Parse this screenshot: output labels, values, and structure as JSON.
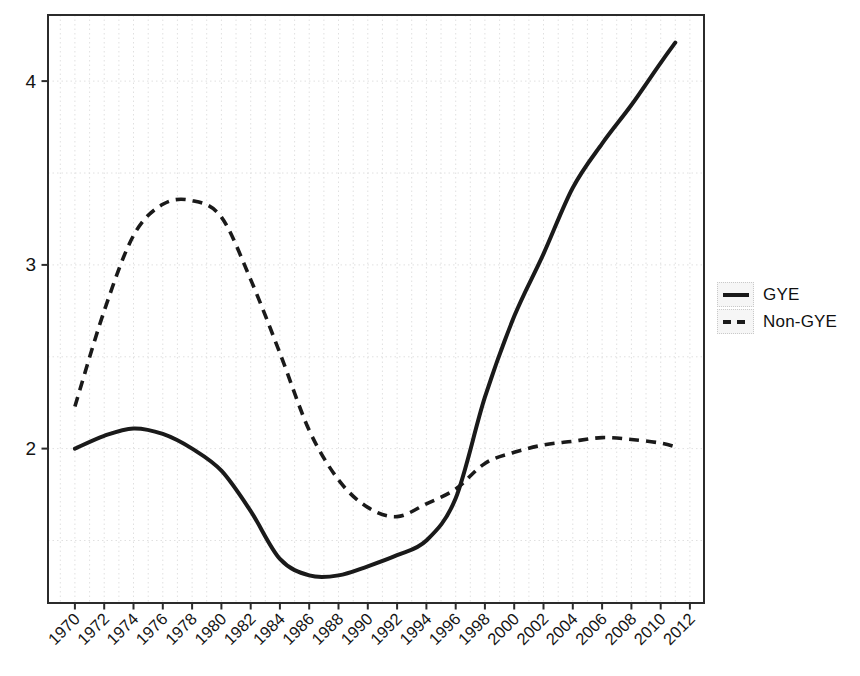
{
  "chart": {
    "background": "#ffffff",
    "curve_color": "#1a1a1a",
    "axis_color": "#2b2b2b",
    "grid_color": "#e0e0e0",
    "label_color": "#141414",
    "legend_key_bg": "#f6f6f6",
    "legend_key_border": "#c9c9c9"
  },
  "chart_data": {
    "type": "line",
    "title": "",
    "xlabel": "",
    "ylabel": "",
    "grid": "faint dotted, vertical every year, horizontal every 0.5",
    "legend_position": "right-middle",
    "x_ticks": [
      1970,
      1972,
      1974,
      1976,
      1978,
      1980,
      1982,
      1984,
      1986,
      1988,
      1990,
      1992,
      1994,
      1996,
      1998,
      2000,
      2002,
      2004,
      2006,
      2008,
      2010,
      2012
    ],
    "y_ticks": [
      2,
      3,
      4
    ],
    "x_range": [
      1968.16,
      2012.96
    ],
    "ylim": [
      1.16,
      4.36
    ],
    "y_grid_step": 0.5,
    "x_grid_step": 1,
    "x": [
      1970,
      1972,
      1974,
      1976,
      1978,
      1980,
      1982,
      1984,
      1986,
      1988,
      1990,
      1992,
      1994,
      1996,
      1998,
      2000,
      2002,
      2004,
      2006,
      2008,
      2010,
      2011
    ],
    "series": [
      {
        "name": "GYE",
        "style": "solid",
        "values": [
          2.0,
          2.07,
          2.11,
          2.08,
          2.0,
          1.88,
          1.66,
          1.4,
          1.31,
          1.31,
          1.36,
          1.42,
          1.5,
          1.73,
          2.28,
          2.72,
          3.06,
          3.42,
          3.66,
          3.87,
          4.1,
          4.21
        ]
      },
      {
        "name": "Non-GYE",
        "style": "dashed",
        "values": [
          2.23,
          2.75,
          3.16,
          3.33,
          3.35,
          3.26,
          2.92,
          2.52,
          2.1,
          1.83,
          1.68,
          1.63,
          1.7,
          1.78,
          1.92,
          1.98,
          2.02,
          2.04,
          2.06,
          2.05,
          2.03,
          2.01
        ]
      }
    ]
  },
  "legend": {
    "items": [
      {
        "label": "GYE",
        "style": "solid"
      },
      {
        "label": "Non-GYE",
        "style": "dashed"
      }
    ]
  }
}
